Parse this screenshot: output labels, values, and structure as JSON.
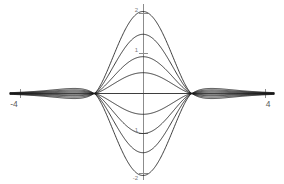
{
  "figure": {
    "name": "curve-family-plot",
    "background_color": "#ffffff",
    "axis_color": "#8c8c8c",
    "curve_color": "#1a1a1a"
  },
  "axes": {
    "x_axis_label": "",
    "y_axis_label": "",
    "x_ticks": [
      {
        "value": -4,
        "label": "-4",
        "px": 20
      },
      {
        "value": 4,
        "label": "4",
        "px": 266
      }
    ],
    "y_ticks": [
      {
        "value": 2,
        "label": "2",
        "px": 13
      },
      {
        "value": 1,
        "label": "1",
        "px": 53
      },
      {
        "value": -1,
        "label": "-1",
        "px": 133
      },
      {
        "value": -2,
        "label": "-2",
        "px": 173
      }
    ]
  },
  "chart_data": {
    "type": "line",
    "title": "",
    "subtitle": "",
    "xlabel": "",
    "ylabel": "",
    "xlim": [
      -4.4,
      4.4
    ],
    "ylim": [
      -2.3,
      2.3
    ],
    "grid": false,
    "legend": "none",
    "annotations": [],
    "node_x": [
      -1.6,
      1.6
    ],
    "x": [
      -4.4,
      -4.0,
      -3.5,
      -3.0,
      -2.5,
      -2.0,
      -1.6,
      -1.2,
      -0.8,
      -0.4,
      0.0,
      0.4,
      0.8,
      1.2,
      1.6,
      2.0,
      2.5,
      3.0,
      3.5,
      4.0,
      4.4
    ],
    "series": [
      {
        "name": "amplitude +2.05",
        "amplitude": 2.05,
        "color": "#1a1a1a",
        "values": [
          0.01,
          0.02,
          0.05,
          0.1,
          0.22,
          0.52,
          0.0,
          1.18,
          1.72,
          1.99,
          2.05,
          1.99,
          1.72,
          1.18,
          0.0,
          0.52,
          0.22,
          0.1,
          0.05,
          0.02,
          0.01
        ]
      },
      {
        "name": "amplitude +1.48",
        "amplitude": 1.48,
        "color": "#1a1a1a",
        "values": [
          0.01,
          0.02,
          0.04,
          0.08,
          0.17,
          0.39,
          0.0,
          0.86,
          1.25,
          1.44,
          1.48,
          1.44,
          1.25,
          0.86,
          0.0,
          0.39,
          0.17,
          0.08,
          0.04,
          0.02,
          0.01
        ]
      },
      {
        "name": "amplitude +0.92",
        "amplitude": 0.92,
        "color": "#1a1a1a",
        "values": [
          0.01,
          0.01,
          0.03,
          0.05,
          0.11,
          0.25,
          0.0,
          0.54,
          0.78,
          0.9,
          0.92,
          0.9,
          0.78,
          0.54,
          0.0,
          0.25,
          0.11,
          0.05,
          0.03,
          0.01,
          0.01
        ]
      },
      {
        "name": "amplitude +0.52",
        "amplitude": 0.52,
        "color": "#1a1a1a",
        "values": [
          0.0,
          0.01,
          0.02,
          0.03,
          0.06,
          0.14,
          0.0,
          0.31,
          0.44,
          0.51,
          0.52,
          0.51,
          0.44,
          0.31,
          0.0,
          0.14,
          0.06,
          0.03,
          0.02,
          0.01,
          0.0
        ]
      },
      {
        "name": "amplitude -0.52",
        "amplitude": -0.52,
        "color": "#1a1a1a",
        "values": [
          0.0,
          -0.01,
          -0.02,
          -0.03,
          -0.06,
          -0.14,
          0.0,
          -0.31,
          -0.44,
          -0.51,
          -0.52,
          -0.51,
          -0.44,
          -0.31,
          0.0,
          -0.14,
          -0.06,
          -0.03,
          -0.02,
          -0.01,
          0.0
        ]
      },
      {
        "name": "amplitude -1.00",
        "amplitude": -1.0,
        "color": "#1a1a1a",
        "values": [
          -0.01,
          -0.01,
          -0.03,
          -0.05,
          -0.12,
          -0.27,
          0.0,
          -0.58,
          -0.85,
          -0.98,
          -1.0,
          -0.98,
          -0.85,
          -0.58,
          0.0,
          -0.27,
          -0.12,
          -0.05,
          -0.03,
          -0.01,
          -0.01
        ]
      },
      {
        "name": "amplitude -1.48",
        "amplitude": -1.48,
        "color": "#1a1a1a",
        "values": [
          -0.01,
          -0.02,
          -0.04,
          -0.08,
          -0.17,
          -0.39,
          0.0,
          -0.86,
          -1.25,
          -1.44,
          -1.48,
          -1.44,
          -1.25,
          -0.86,
          0.0,
          -0.39,
          -0.17,
          -0.08,
          -0.04,
          -0.02,
          -0.01
        ]
      },
      {
        "name": "amplitude -2.05",
        "amplitude": -2.05,
        "color": "#1a1a1a",
        "values": [
          -0.01,
          -0.02,
          -0.05,
          -0.1,
          -0.22,
          -0.52,
          0.0,
          -1.18,
          -1.72,
          -1.99,
          -2.05,
          -1.99,
          -1.72,
          -1.18,
          0.0,
          -0.52,
          -0.22,
          -0.1,
          -0.05,
          -0.02,
          -0.01
        ]
      },
      {
        "name": "zero baseline",
        "amplitude": 0.0,
        "color": "#1a1a1a",
        "values": [
          0,
          0,
          0,
          0,
          0,
          0,
          0,
          0,
          0,
          0,
          0,
          0,
          0,
          0,
          0,
          0,
          0,
          0,
          0,
          0,
          0
        ]
      }
    ]
  }
}
